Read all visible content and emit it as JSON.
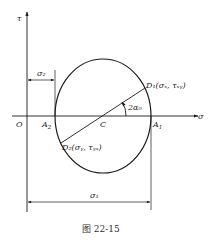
{
  "figure": {
    "caption": "图 22-15",
    "type": "Mohr's stress circle"
  },
  "axes": {
    "x_label": "σ",
    "y_label": "τ",
    "origin_label": "O"
  },
  "points": {
    "A1": "A",
    "A1_sub": "1",
    "A2": "A",
    "A2_sub": "2",
    "C": "C",
    "D1": "D₁(σₓ, τₓᵧ)",
    "D2": "D₂(σᵧ, τᵧₓ)"
  },
  "angle": {
    "label": "2α₀"
  },
  "dimensions": {
    "sigma1": "σ₁",
    "sigma2": "σ₂"
  },
  "colors": {
    "line": "#1a1a1a",
    "background": "#ffffff"
  }
}
